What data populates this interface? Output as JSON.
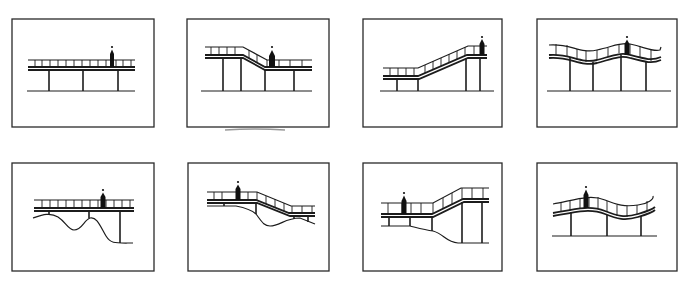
{
  "figure": {
    "layout": "2 rows x 4 columns of framed line drawings",
    "panels": [
      {
        "id": 1,
        "row": 1,
        "col": 1,
        "deck": "flat",
        "ground": "flat",
        "columns": 3,
        "figure_position": "right"
      },
      {
        "id": 2,
        "row": 1,
        "col": 2,
        "deck": "high left, ramp down to lower right level",
        "ground": "flat",
        "columns": 4,
        "figure_position": "center (at bottom of ramp)"
      },
      {
        "id": 3,
        "row": 1,
        "col": 3,
        "deck": "low left, long ramp up to high right landing",
        "ground": "flat",
        "columns": 4,
        "figure_position": "right (top landing)"
      },
      {
        "id": 4,
        "row": 1,
        "col": 4,
        "deck": "undulating wave",
        "ground": "flat",
        "columns": 4,
        "figure_position": "right crest"
      },
      {
        "id": 5,
        "row": 2,
        "col": 1,
        "deck": "flat",
        "ground": "undulating terrain with dips",
        "columns": 3,
        "figure_position": "right"
      },
      {
        "id": 6,
        "row": 2,
        "col": 2,
        "deck": "flat left, ramp down to lower right",
        "ground": "sloping terrain with a dip",
        "columns": 3,
        "figure_position": "left"
      },
      {
        "id": 7,
        "row": 2,
        "col": 3,
        "deck": "flat left, ramp up to high right",
        "ground": "stepped terrain descending to right",
        "columns": 5,
        "figure_position": "left"
      },
      {
        "id": 8,
        "row": 2,
        "col": 4,
        "deck": "gentle wave",
        "ground": "flat",
        "columns": 3,
        "figure_position": "left"
      }
    ]
  }
}
